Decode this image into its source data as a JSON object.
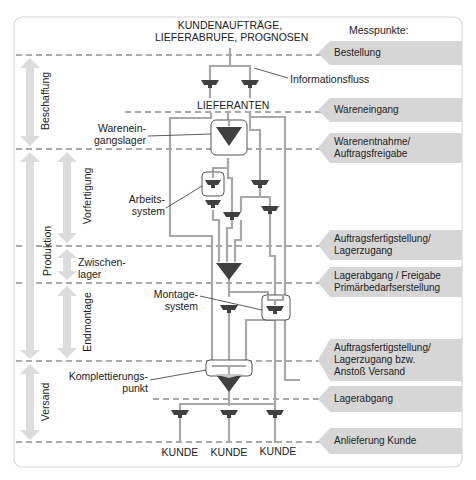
{
  "header": {
    "title_line1": "KUNDENAUFTRÄGE,",
    "title_line2": "LIEFERABRUFE, PROGNOSEN",
    "measure_points_label": "Messpunkte:"
  },
  "labels": {
    "info_flow": "Informationsfluss",
    "suppliers": "LIEFERANTEN",
    "goods_receipt_store_1": "Warenein-",
    "goods_receipt_store_2": "gangslager",
    "work_system_1": "Arbeits-",
    "work_system_2": "system",
    "assembly_system_1": "Montage-",
    "assembly_system_2": "system",
    "completion_point_1": "Komplettierungs-",
    "completion_point_2": "punkt",
    "customers": [
      "KUNDE",
      "KUNDE",
      "KUNDE"
    ]
  },
  "phases": {
    "procurement": "Beschaffung",
    "production": "Produktion",
    "pre_production": "Vorfertigung",
    "intermediate_store_1": "Zwischen-",
    "intermediate_store_2": "lager",
    "final_assembly": "Endmontage",
    "shipping": "Versand"
  },
  "measure_points": [
    {
      "lines": [
        "Bestellung"
      ]
    },
    {
      "lines": [
        "Wareneingang"
      ]
    },
    {
      "lines": [
        "Warenentnahme/",
        "Auftragsfreigabe"
      ]
    },
    {
      "lines": [
        "Auftragsfertigstellung/",
        "Lagerzugang"
      ]
    },
    {
      "lines": [
        "Lagerabgang / Freigabe",
        "Primärbedarfserstellung"
      ]
    },
    {
      "lines": [
        "Auftragsfertigstellung/",
        "Lagerzugang bzw.",
        "Anstoß Versand"
      ]
    },
    {
      "lines": [
        "Lagerabgang"
      ]
    },
    {
      "lines": [
        "Anlieferung Kunde"
      ]
    }
  ],
  "colors": {
    "flow_line": "#a8a8a8",
    "symbol": "#404040",
    "phase_arrow": "#dcdcdc",
    "measure_tag": "#d6d6d6",
    "dashed": "#555555"
  }
}
